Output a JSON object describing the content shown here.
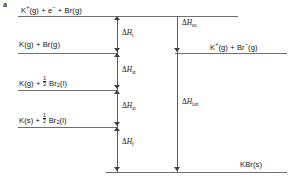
{
  "figure": {
    "panel_letter": "a",
    "type": "energy-level-diagram"
  },
  "levels": [
    {
      "id": "level-top",
      "label_html": "K<sup>+</sup>(g) + e<sup>−</sup> + Br(g)",
      "label_text": "K+(g) + e- + Br(g)",
      "side": "left"
    },
    {
      "id": "level-k-br-gas",
      "label_html": "K(g) + Br(g)",
      "label_text": "K(g) + Br(g)",
      "side": "left"
    },
    {
      "id": "level-kg-half-br2",
      "label_html": "K(g) + <span class=\"frac\"><span class=\"num\">1</span><span class=\"den\">2</span></span> Br<sub>2</sub>(l)",
      "label_text": "K(g) + 1/2 Br2(l)",
      "side": "left"
    },
    {
      "id": "level-ks-half-br2",
      "label_html": "K(s) + <span class=\"frac\"><span class=\"num\">1</span><span class=\"den\">2</span></span> Br<sub>2</sub>(l)",
      "label_text": "K(s) + 1/2 Br2(l)",
      "side": "left"
    },
    {
      "id": "level-ions-gas",
      "label_html": "K<sup>+</sup>(g) + Br<sup>−</sup>(g)",
      "label_text": "K+(g) + Br-(g)",
      "side": "right"
    },
    {
      "id": "level-kbr-solid",
      "label_html": "KBr(s)",
      "label_text": "KBr(s)",
      "side": "right"
    }
  ],
  "enthalpies": [
    {
      "id": "dh-ionisation",
      "symbol_html": "Δ<span class=\"it\">H</span><sub>i</sub>",
      "symbol_text": "ΔHi",
      "meaning": "ionisation enthalpy"
    },
    {
      "id": "dh-atomisation-br",
      "symbol_html": "Δ<span class=\"it\">H</span><sub>at</sub>",
      "symbol_text": "ΔHat",
      "meaning": "atomisation enthalpy of bromine"
    },
    {
      "id": "dh-atomisation-k",
      "symbol_html": "Δ<span class=\"it\">H</span><sub>at</sub>",
      "symbol_text": "ΔHat",
      "meaning": "atomisation enthalpy of potassium"
    },
    {
      "id": "dh-formation",
      "symbol_html": "Δ<span class=\"it\">H</span><sub>f</sub>",
      "symbol_text": "ΔHf",
      "meaning": "enthalpy of formation"
    },
    {
      "id": "dh-electron-affinity",
      "symbol_html": "Δ<span class=\"it\">H</span><sub>ea</sub>",
      "symbol_text": "ΔHea",
      "meaning": "electron affinity"
    },
    {
      "id": "dh-lattice",
      "symbol_html": "Δ<span class=\"it\">H</span><sub>latt</sub>",
      "symbol_text": "ΔHlatt",
      "meaning": "lattice enthalpy"
    }
  ],
  "colors": {
    "line": "#6f6f6f",
    "stem": "#5d5d5d",
    "arrowhead": "#3d3d3d",
    "text": "#141414",
    "background": "#ffffff"
  }
}
